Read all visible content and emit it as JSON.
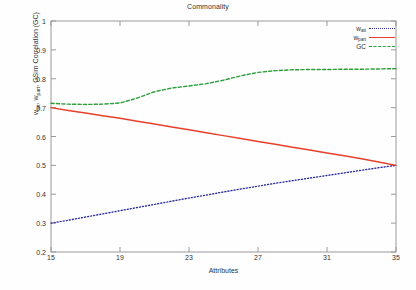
{
  "chart_data": {
    "type": "line",
    "title": "Commonality",
    "xlabel": "Attributes",
    "ylabel": "w_att, w_part, GSim Correlation (GC)",
    "xlim": [
      15,
      35
    ],
    "ylim": [
      0.2,
      1
    ],
    "grid": false,
    "legend_position": "top-right-inside",
    "xticks": [
      "15",
      "19",
      "23",
      "27",
      "31",
      "35"
    ],
    "xtick_values": [
      15,
      19,
      23,
      27,
      31,
      35
    ],
    "yticks": [
      "0.2",
      "0.3",
      "0.4",
      "0.5",
      "0.6",
      "0.7",
      "0.8",
      "0.9",
      "1"
    ],
    "ytick_values": [
      0.2,
      0.3,
      0.4,
      0.5,
      0.6,
      0.7,
      0.8,
      0.9,
      1
    ],
    "x": [
      15,
      16,
      17,
      18,
      19,
      20,
      21,
      22,
      23,
      24,
      25,
      26,
      27,
      28,
      29,
      30,
      31,
      32,
      33,
      34,
      35
    ],
    "series": [
      {
        "name": "w_att",
        "name_base": "w",
        "name_sub": "att",
        "color": "#30309a",
        "style": "dotted",
        "values": [
          0.3,
          0.31,
          0.321,
          0.332,
          0.343,
          0.354,
          0.365,
          0.376,
          0.387,
          0.397,
          0.408,
          0.418,
          0.428,
          0.438,
          0.447,
          0.456,
          0.465,
          0.474,
          0.483,
          0.492,
          0.5
        ]
      },
      {
        "name": "w_part",
        "name_base": "w",
        "name_sub": "part",
        "color": "#e8402a",
        "style": "solid",
        "values": [
          0.7,
          0.69,
          0.681,
          0.672,
          0.663,
          0.653,
          0.643,
          0.633,
          0.623,
          0.613,
          0.603,
          0.593,
          0.583,
          0.573,
          0.563,
          0.553,
          0.543,
          0.533,
          0.523,
          0.512,
          0.5
        ]
      },
      {
        "name": "GC",
        "name_base": "GC",
        "name_sub": "",
        "color": "#2f9e3f",
        "style": "dashed",
        "values": [
          0.715,
          0.712,
          0.711,
          0.712,
          0.716,
          0.733,
          0.755,
          0.768,
          0.775,
          0.783,
          0.795,
          0.81,
          0.822,
          0.828,
          0.831,
          0.832,
          0.832,
          0.833,
          0.833,
          0.834,
          0.835
        ]
      }
    ]
  },
  "legend": {
    "entries": [
      {
        "label_base": "w",
        "label_sub": "att"
      },
      {
        "label_base": "w",
        "label_sub": "part"
      },
      {
        "label_base": "GC",
        "label_sub": ""
      }
    ]
  },
  "caption": {
    "text": ""
  }
}
